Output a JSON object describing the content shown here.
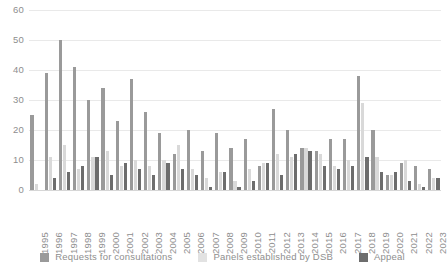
{
  "chart_data": {
    "type": "bar",
    "title": "",
    "xlabel": "",
    "ylabel": "",
    "ylim": [
      0,
      60
    ],
    "yticks": [
      0,
      10,
      20,
      30,
      40,
      50,
      60
    ],
    "grid": true,
    "legend_position": "bottom",
    "categories": [
      "1995",
      "1996",
      "1997",
      "1998",
      "1999",
      "2000",
      "2001",
      "2002",
      "2003",
      "2004",
      "2005",
      "2006",
      "2007",
      "2008",
      "2009",
      "2010",
      "2011",
      "2012",
      "2013",
      "2014",
      "2015",
      "2016",
      "2017",
      "2018",
      "2019",
      "2020",
      "2021",
      "2022",
      "2023"
    ],
    "series": [
      {
        "name": "Requests for consultations",
        "color": "#9a9a9a",
        "values": [
          25,
          39,
          50,
          41,
          30,
          34,
          23,
          37,
          26,
          19,
          12,
          20,
          13,
          19,
          14,
          17,
          8,
          27,
          20,
          14,
          13,
          17,
          17,
          38,
          20,
          5,
          9,
          8,
          7
        ]
      },
      {
        "name": "Panels established by DSB",
        "color": "#d9d9d9",
        "values": [
          2,
          11,
          15,
          7,
          11,
          13,
          8,
          10,
          8,
          10,
          15,
          7,
          4,
          6,
          3,
          7,
          9,
          12,
          11,
          14,
          12,
          8,
          10,
          29,
          11,
          5,
          10,
          2,
          4
        ]
      },
      {
        "name": "Appeal",
        "color": "#6d6d6d",
        "values": [
          0,
          4,
          6,
          8,
          11,
          5,
          9,
          7,
          5,
          9,
          7,
          5,
          1,
          6,
          1,
          3,
          9,
          5,
          12,
          13,
          8,
          7,
          8,
          11,
          6,
          6,
          3,
          1,
          4
        ]
      }
    ]
  },
  "legend": {
    "items": [
      {
        "label": "Requests for consultations",
        "swatch": "s0"
      },
      {
        "label": "Panels established by DSB",
        "swatch": "s1"
      },
      {
        "label": "Appeal",
        "swatch": "s2"
      }
    ]
  }
}
